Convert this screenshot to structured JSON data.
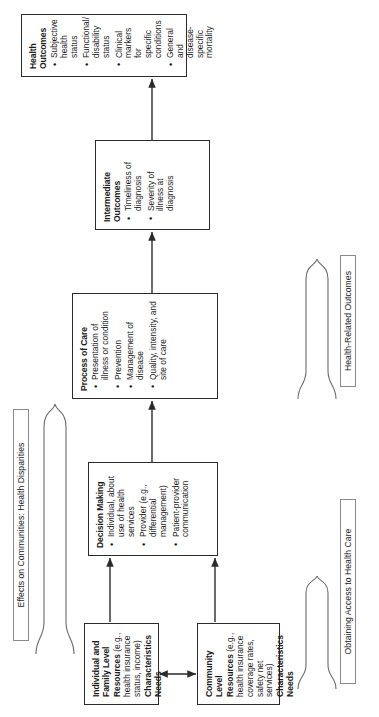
{
  "figure": {
    "orientation": "rotated-90-ccw",
    "line_color": "#2b2b2b",
    "caption_border_color": "#8a8a8a",
    "background": "#ffffff"
  },
  "nodes": {
    "individual_family": {
      "title": "Individual and Family Level",
      "resources_label": "Resources",
      "resources_detail": "(e.g., health insurance status, income)",
      "line2": "Characteristics",
      "line3": "Needs"
    },
    "community": {
      "title": "Community Level",
      "resources_label": "Resources",
      "resources_detail": "(e.g., health insurance coverage rates, safety net services)",
      "line2": "Characteristics",
      "line3": "Needs"
    },
    "decision_making": {
      "title": "Decision Making",
      "bullets": [
        "Individual, about use of health services",
        "Provider (e.g., differential management)",
        "Patient-provider communication"
      ]
    },
    "process_of_care": {
      "title": "Process of Care",
      "bullets": [
        "Presentation of illness or condition",
        "Prevention",
        "Management of disease",
        "Quality, intensity, and site of care"
      ]
    },
    "intermediate_outcomes": {
      "title": "Intermediate Outcomes",
      "bullets": [
        "Timeliness of diagnosis",
        "Severity of illness at diagnosis"
      ]
    },
    "health_outcomes": {
      "title": "Health Outcomes",
      "bullets": [
        "Subjective health status",
        "Functional/ disability status",
        "Clinical markers for specific conditions",
        "General and disease-specific mortality"
      ]
    }
  },
  "captions": {
    "access": "Obtaining Access to Health Care",
    "outcomes": "Health-Related Outcomes",
    "effects": "Effects on Communities: Health Disparities"
  }
}
